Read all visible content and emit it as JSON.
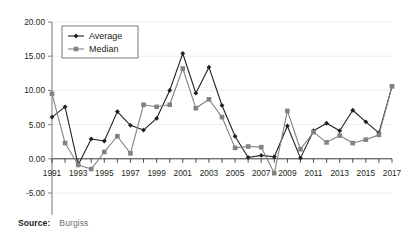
{
  "source": {
    "label": "Source:",
    "value": "Burgiss"
  },
  "legend": {
    "position": "top-left-inside",
    "entries": [
      {
        "name": "Average",
        "marker": "diamond",
        "color": "#231f20"
      },
      {
        "name": "Median",
        "marker": "square",
        "color": "#808285"
      }
    ]
  },
  "axis": {
    "y_ticks": [
      "20.00",
      "15.00",
      "10.00",
      "5.00",
      "0.00",
      "-5.00"
    ],
    "x_ticks": [
      "1991",
      "1993",
      "1995",
      "1997",
      "1999",
      "2001",
      "2003",
      "2005",
      "2007",
      "2009",
      "2011",
      "2013",
      "2015",
      "2017"
    ]
  },
  "chart_data": {
    "type": "line",
    "title": "",
    "subtitle": "",
    "xlabel": "",
    "ylabel": "",
    "xlim": [
      1991,
      2017
    ],
    "ylim": [
      -5.0,
      20.0
    ],
    "ytick_step": 5.0,
    "grid": true,
    "grid_axis": "y",
    "legend_position": "upper left",
    "x": [
      1991,
      1992,
      1993,
      1994,
      1995,
      1996,
      1997,
      1998,
      1999,
      2000,
      2001,
      2002,
      2003,
      2004,
      2005,
      2006,
      2007,
      2008,
      2009,
      2010,
      2011,
      2012,
      2013,
      2014,
      2015,
      2016,
      2017
    ],
    "xtick_labels_shown": [
      "1991",
      "1993",
      "1995",
      "1997",
      "1999",
      "2001",
      "2003",
      "2005",
      "2007",
      "2009",
      "2011",
      "2013",
      "2015",
      "2017"
    ],
    "series": [
      {
        "name": "Average",
        "marker": "diamond",
        "color": "#231f20",
        "values": [
          6.1,
          7.6,
          -0.9,
          2.9,
          2.6,
          6.9,
          4.9,
          4.2,
          5.9,
          10.0,
          15.4,
          9.6,
          13.4,
          7.8,
          3.3,
          0.2,
          0.5,
          0.3,
          4.8,
          0.1,
          4.1,
          5.2,
          4.1,
          7.1,
          5.4,
          3.8,
          10.6
        ]
      },
      {
        "name": "Median",
        "marker": "square",
        "color": "#808285",
        "values": [
          9.5,
          2.3,
          -0.9,
          -1.5,
          1.0,
          3.3,
          0.8,
          7.9,
          7.6,
          7.9,
          13.2,
          7.4,
          8.7,
          6.1,
          1.6,
          1.8,
          1.7,
          -2.1,
          7.0,
          1.4,
          3.9,
          2.4,
          3.4,
          2.3,
          2.8,
          3.5,
          10.6
        ]
      }
    ]
  }
}
